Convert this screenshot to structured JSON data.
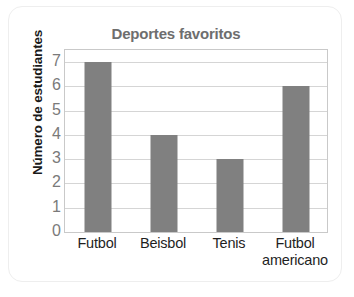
{
  "chart_data": {
    "type": "bar",
    "title": "Deportes favoritos",
    "xlabel": "",
    "ylabel": "Número de estudiantes",
    "categories": [
      "Futbol",
      "Beisbol",
      "Tenis",
      "Futbol americano"
    ],
    "category_lines": [
      [
        "Futbol"
      ],
      [
        "Beisbol"
      ],
      [
        "Tenis"
      ],
      [
        "Futbol",
        "americano"
      ]
    ],
    "values": [
      7,
      4,
      3,
      6
    ],
    "ylim": [
      0,
      7
    ],
    "ytick_labels": [
      "7",
      "6",
      "5",
      "4",
      "3",
      "2",
      "1",
      "0"
    ],
    "ytick_values": [
      7,
      6,
      5,
      4,
      3,
      2,
      1,
      0
    ],
    "grid": true,
    "legend": null,
    "colors": {
      "bar": "#808080",
      "title_text": "#6e6e6e",
      "axis_title_text": "#1a1a1a",
      "ytick_text": "#7a7a7a",
      "xlabel_text": "#1f1f1f",
      "gridline": "#d5d5d5",
      "plot_border": "#c9c9c9",
      "card_border": "#eeeeee",
      "background": "#ffffff"
    }
  }
}
